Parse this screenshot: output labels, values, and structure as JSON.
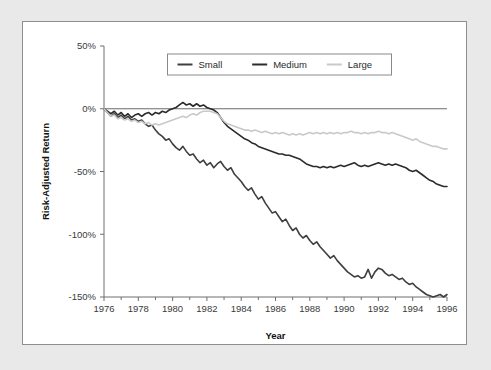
{
  "figure": {
    "background_color": "#e9e9e9",
    "panel_background": "#ffffff",
    "panel_border_color": "#8e8e8e"
  },
  "chart_data": {
    "type": "line",
    "title": "",
    "subtitle": "",
    "xlabel": "Year",
    "ylabel": "Risk-Adjusted Return",
    "xlim": [
      1976,
      1996
    ],
    "ylim": [
      -150,
      50
    ],
    "grid": false,
    "legend_position": "top-center",
    "x_tick_labels": [
      "1976",
      "1978",
      "1980",
      "1982",
      "1984",
      "1986",
      "1988",
      "1990",
      "1992",
      "1994",
      "1996"
    ],
    "x_ticks": [
      1976,
      1978,
      1980,
      1982,
      1984,
      1986,
      1988,
      1990,
      1992,
      1994,
      1996
    ],
    "y_tick_labels": [
      "50%",
      "0%",
      "-50%",
      "-100%",
      "-150%"
    ],
    "y_ticks": [
      50,
      0,
      -50,
      -100,
      -150
    ],
    "x_minor_tick_interval": 1,
    "annotations": [
      {
        "text": "zero reference line at 0%",
        "y": 0
      }
    ],
    "series": [
      {
        "name": "Small",
        "color": "#3f3f3f",
        "line_width": 1.6,
        "x": [
          1976.0,
          1976.2,
          1976.4,
          1976.6,
          1976.8,
          1977.0,
          1977.2,
          1977.4,
          1977.6,
          1977.8,
          1978.0,
          1978.2,
          1978.4,
          1978.6,
          1978.8,
          1979.0,
          1979.2,
          1979.4,
          1979.6,
          1979.8,
          1980.0,
          1980.2,
          1980.4,
          1980.6,
          1980.8,
          1981.0,
          1981.2,
          1981.4,
          1981.6,
          1981.8,
          1982.0,
          1982.2,
          1982.4,
          1982.6,
          1982.8,
          1983.0,
          1983.2,
          1983.4,
          1983.6,
          1983.8,
          1984.0,
          1984.2,
          1984.4,
          1984.6,
          1984.8,
          1985.0,
          1985.2,
          1985.4,
          1985.6,
          1985.8,
          1986.0,
          1986.2,
          1986.4,
          1986.6,
          1986.8,
          1987.0,
          1987.2,
          1987.4,
          1987.6,
          1987.8,
          1988.0,
          1988.2,
          1988.4,
          1988.6,
          1988.8,
          1989.0,
          1989.2,
          1989.4,
          1989.6,
          1989.8,
          1990.0,
          1990.2,
          1990.4,
          1990.6,
          1990.8,
          1991.0,
          1991.2,
          1991.4,
          1991.6,
          1991.8,
          1992.0,
          1992.2,
          1992.4,
          1992.6,
          1992.8,
          1993.0,
          1993.2,
          1993.4,
          1993.6,
          1993.8,
          1994.0,
          1994.2,
          1994.4,
          1994.6,
          1994.8,
          1995.0,
          1995.2,
          1995.4,
          1995.6,
          1995.8,
          1996.0
        ],
        "y": [
          0,
          -3,
          -6,
          -4,
          -7,
          -5,
          -8,
          -6,
          -9,
          -8,
          -10,
          -9,
          -12,
          -14,
          -13,
          -17,
          -20,
          -22,
          -25,
          -24,
          -28,
          -31,
          -33,
          -30,
          -34,
          -37,
          -36,
          -40,
          -43,
          -41,
          -45,
          -43,
          -47,
          -44,
          -42,
          -46,
          -49,
          -47,
          -52,
          -55,
          -58,
          -62,
          -65,
          -63,
          -68,
          -72,
          -70,
          -75,
          -79,
          -83,
          -82,
          -86,
          -90,
          -88,
          -93,
          -97,
          -95,
          -100,
          -103,
          -101,
          -105,
          -108,
          -106,
          -110,
          -113,
          -116,
          -119,
          -117,
          -121,
          -124,
          -127,
          -130,
          -132,
          -134,
          -133,
          -135,
          -134,
          -128,
          -135,
          -130,
          -127,
          -128,
          -131,
          -133,
          -132,
          -134,
          -136,
          -135,
          -138,
          -140,
          -139,
          -142,
          -144,
          -146,
          -148,
          -149,
          -150,
          -149,
          -148,
          -150,
          -148
        ]
      },
      {
        "name": "Medium",
        "color": "#2b2b2b",
        "line_width": 1.6,
        "x": [
          1976.0,
          1976.2,
          1976.4,
          1976.6,
          1976.8,
          1977.0,
          1977.2,
          1977.4,
          1977.6,
          1977.8,
          1978.0,
          1978.2,
          1978.4,
          1978.6,
          1978.8,
          1979.0,
          1979.2,
          1979.4,
          1979.6,
          1979.8,
          1980.0,
          1980.2,
          1980.4,
          1980.6,
          1980.8,
          1981.0,
          1981.2,
          1981.4,
          1981.6,
          1981.8,
          1982.0,
          1982.2,
          1982.4,
          1982.6,
          1982.8,
          1983.0,
          1983.2,
          1983.4,
          1983.6,
          1983.8,
          1984.0,
          1984.2,
          1984.4,
          1984.6,
          1984.8,
          1985.0,
          1985.2,
          1985.4,
          1985.6,
          1985.8,
          1986.0,
          1986.2,
          1986.4,
          1986.6,
          1986.8,
          1987.0,
          1987.2,
          1987.4,
          1987.6,
          1987.8,
          1988.0,
          1988.2,
          1988.4,
          1988.6,
          1988.8,
          1989.0,
          1989.2,
          1989.4,
          1989.6,
          1989.8,
          1990.0,
          1990.2,
          1990.4,
          1990.6,
          1990.8,
          1991.0,
          1991.2,
          1991.4,
          1991.6,
          1991.8,
          1992.0,
          1992.2,
          1992.4,
          1992.6,
          1992.8,
          1993.0,
          1993.2,
          1993.4,
          1993.6,
          1993.8,
          1994.0,
          1994.2,
          1994.4,
          1994.6,
          1994.8,
          1995.0,
          1995.2,
          1995.4,
          1995.6,
          1995.8,
          1996.0
        ],
        "y": [
          0,
          -2,
          -4,
          -2,
          -5,
          -3,
          -6,
          -4,
          -7,
          -5,
          -4,
          -6,
          -4,
          -3,
          -5,
          -3,
          -4,
          -2,
          -3,
          -1,
          0,
          1,
          3,
          5,
          3,
          4,
          2,
          4,
          2,
          3,
          1,
          0,
          -1,
          -3,
          -7,
          -11,
          -14,
          -16,
          -18,
          -20,
          -22,
          -24,
          -25,
          -27,
          -28,
          -30,
          -31,
          -32,
          -33,
          -34,
          -35,
          -36,
          -36,
          -37,
          -37,
          -38,
          -39,
          -40,
          -42,
          -44,
          -45,
          -46,
          -46,
          -47,
          -46,
          -47,
          -46,
          -47,
          -46,
          -45,
          -46,
          -45,
          -44,
          -43,
          -45,
          -46,
          -45,
          -46,
          -45,
          -44,
          -43,
          -44,
          -45,
          -44,
          -45,
          -44,
          -45,
          -46,
          -47,
          -49,
          -50,
          -49,
          -51,
          -53,
          -55,
          -57,
          -58,
          -60,
          -61,
          -62,
          -62
        ]
      },
      {
        "name": "Large",
        "color": "#c9c9c9",
        "line_width": 1.6,
        "x": [
          1976.0,
          1976.2,
          1976.4,
          1976.6,
          1976.8,
          1977.0,
          1977.2,
          1977.4,
          1977.6,
          1977.8,
          1978.0,
          1978.2,
          1978.4,
          1978.6,
          1978.8,
          1979.0,
          1979.2,
          1979.4,
          1979.6,
          1979.8,
          1980.0,
          1980.2,
          1980.4,
          1980.6,
          1980.8,
          1981.0,
          1981.2,
          1981.4,
          1981.6,
          1981.8,
          1982.0,
          1982.2,
          1982.4,
          1982.6,
          1982.8,
          1983.0,
          1983.2,
          1983.4,
          1983.6,
          1983.8,
          1984.0,
          1984.2,
          1984.4,
          1984.6,
          1984.8,
          1985.0,
          1985.2,
          1985.4,
          1985.6,
          1985.8,
          1986.0,
          1986.2,
          1986.4,
          1986.6,
          1986.8,
          1987.0,
          1987.2,
          1987.4,
          1987.6,
          1987.8,
          1988.0,
          1988.2,
          1988.4,
          1988.6,
          1988.8,
          1989.0,
          1989.2,
          1989.4,
          1989.6,
          1989.8,
          1990.0,
          1990.2,
          1990.4,
          1990.6,
          1990.8,
          1991.0,
          1991.2,
          1991.4,
          1991.6,
          1991.8,
          1992.0,
          1992.2,
          1992.4,
          1992.6,
          1992.8,
          1993.0,
          1993.2,
          1993.4,
          1993.6,
          1993.8,
          1994.0,
          1994.2,
          1994.4,
          1994.6,
          1994.8,
          1995.0,
          1995.2,
          1995.4,
          1995.6,
          1995.8,
          1996.0
        ],
        "y": [
          0,
          -3,
          -6,
          -5,
          -8,
          -7,
          -9,
          -8,
          -10,
          -9,
          -11,
          -10,
          -12,
          -11,
          -13,
          -12,
          -13,
          -12,
          -11,
          -10,
          -9,
          -8,
          -7,
          -6,
          -7,
          -5,
          -4,
          -5,
          -3,
          -2,
          -2,
          -2,
          -3,
          -4,
          -7,
          -10,
          -12,
          -13,
          -14,
          -15,
          -16,
          -17,
          -17,
          -18,
          -17,
          -18,
          -19,
          -18,
          -19,
          -20,
          -19,
          -20,
          -19,
          -20,
          -21,
          -20,
          -21,
          -20,
          -21,
          -20,
          -19,
          -20,
          -19,
          -20,
          -19,
          -20,
          -19,
          -20,
          -19,
          -20,
          -19,
          -19,
          -18,
          -19,
          -19,
          -20,
          -19,
          -20,
          -19,
          -19,
          -18,
          -19,
          -19,
          -20,
          -19,
          -20,
          -21,
          -22,
          -23,
          -24,
          -25,
          -24,
          -26,
          -27,
          -28,
          -29,
          -30,
          -30,
          -31,
          -32,
          -32
        ]
      }
    ]
  },
  "legend": {
    "items": [
      {
        "label": "Small",
        "color": "#3f3f3f"
      },
      {
        "label": "Medium",
        "color": "#2b2b2b"
      },
      {
        "label": "Large",
        "color": "#c9c9c9"
      }
    ]
  }
}
